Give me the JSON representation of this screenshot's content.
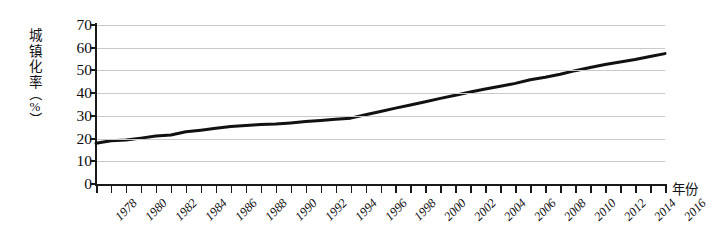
{
  "chart_data": {
    "type": "line",
    "title": "",
    "xlabel": "年份",
    "ylabel": "城镇化率（%）",
    "ylabel_chars": [
      "城",
      "镇",
      "化",
      "率"
    ],
    "ylabel_unit_open": "（",
    "ylabel_unit": "%",
    "ylabel_unit_close": "）",
    "xlim": [
      1978,
      2016
    ],
    "ylim": [
      0,
      70
    ],
    "yticks": [
      0,
      10,
      20,
      30,
      40,
      50,
      60,
      70
    ],
    "ytick_labels": [
      "0",
      "10",
      "20",
      "30",
      "40",
      "50",
      "60",
      "70"
    ],
    "xtick_labels": [
      "1978",
      "1980",
      "1982",
      "1984",
      "1986",
      "1988",
      "1990",
      "1992",
      "1994",
      "1996",
      "1998",
      "2000",
      "2002",
      "2004",
      "2006",
      "2008",
      "2010",
      "2012",
      "2014",
      "2016"
    ],
    "xtick_values": [
      1978,
      1980,
      1982,
      1984,
      1986,
      1988,
      1990,
      1992,
      1994,
      1996,
      1998,
      2000,
      2002,
      2004,
      2006,
      2008,
      2010,
      2012,
      2014,
      2016
    ],
    "xtick_minor_step": 1,
    "grid": true,
    "grid_axis": "y",
    "grid_color": "#c9c9c9",
    "legend": null,
    "line_color": "#111111",
    "line_width": 3,
    "x": [
      1978,
      1979,
      1980,
      1981,
      1982,
      1983,
      1984,
      1985,
      1986,
      1987,
      1988,
      1989,
      1990,
      1991,
      1992,
      1993,
      1994,
      1995,
      1996,
      1997,
      1998,
      1999,
      2000,
      2001,
      2002,
      2003,
      2004,
      2005,
      2006,
      2007,
      2008,
      2009,
      2010,
      2011,
      2012,
      2013,
      2014,
      2015,
      2016
    ],
    "values": [
      17.9,
      19.0,
      19.4,
      20.2,
      21.1,
      21.6,
      23.0,
      23.7,
      24.5,
      25.3,
      25.8,
      26.2,
      26.4,
      26.9,
      27.5,
      28.0,
      28.5,
      29.0,
      30.5,
      31.9,
      33.4,
      34.8,
      36.2,
      37.7,
      39.1,
      40.5,
      41.8,
      43.0,
      44.3,
      45.9,
      47.0,
      48.3,
      49.9,
      51.3,
      52.6,
      53.7,
      54.8,
      56.1,
      57.4
    ]
  }
}
